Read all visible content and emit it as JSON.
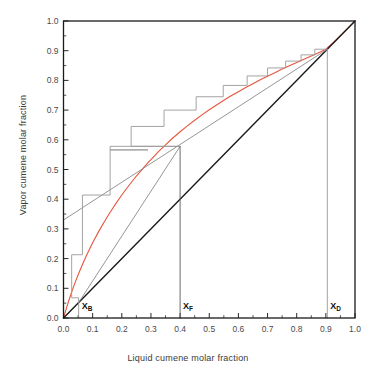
{
  "figure": {
    "kind": "mccabe-thiele-diagram",
    "background_color": "#ffffff",
    "frame_color": "#1a1a1a"
  },
  "axes": {
    "x_title": "Liquid cumene molar fraction",
    "y_title": "Vapor cumene molar fraction",
    "x_ticks": [
      "0.0",
      "0.1",
      "0.2",
      "0.3",
      "0.4",
      "0.5",
      "0.6",
      "0.7",
      "0.8",
      "0.9",
      "1.0"
    ],
    "y_ticks": [
      "0.0",
      "0.1",
      "0.2",
      "0.3",
      "0.4",
      "0.5",
      "0.6",
      "0.7",
      "0.8",
      "0.9",
      "1.0"
    ],
    "x_tick_values": [
      0.0,
      0.1,
      0.2,
      0.3,
      0.4,
      0.5,
      0.6,
      0.7,
      0.8,
      0.9,
      1.0
    ],
    "y_tick_values": [
      0.0,
      0.1,
      0.2,
      0.3,
      0.4,
      0.5,
      0.6,
      0.7,
      0.8,
      0.9,
      1.0
    ],
    "xlim": [
      0.0,
      1.0
    ],
    "ylim": [
      0.0,
      1.0
    ],
    "minor_tick_step": 0.05,
    "grid": false
  },
  "markers": [
    {
      "id": "xB",
      "label": "X",
      "sub": "B",
      "x": 0.052,
      "tick_label": "X_B"
    },
    {
      "id": "xF",
      "label": "X",
      "sub": "F",
      "x": 0.4,
      "tick_label": "X_F"
    },
    {
      "id": "xD",
      "label": "X",
      "sub": "D",
      "x": 0.905,
      "tick_label": "X_D"
    }
  ],
  "chart_data": {
    "type": "line",
    "title": "",
    "xlabel": "Liquid cumene molar fraction",
    "ylabel": "Vapor cumene molar fraction",
    "xlim": [
      0.0,
      1.0
    ],
    "ylim": [
      0.0,
      1.0
    ],
    "grid": false,
    "legend": "none",
    "series": [
      {
        "name": "equilibrium-curve",
        "color": "#e8553c",
        "width": 1.1,
        "points": [
          [
            0.0,
            0.0
          ],
          [
            0.01,
            0.033
          ],
          [
            0.02,
            0.064
          ],
          [
            0.03,
            0.093
          ],
          [
            0.04,
            0.12
          ],
          [
            0.052,
            0.15
          ],
          [
            0.065,
            0.18
          ],
          [
            0.08,
            0.213
          ],
          [
            0.1,
            0.253
          ],
          [
            0.12,
            0.29
          ],
          [
            0.14,
            0.324
          ],
          [
            0.16,
            0.356
          ],
          [
            0.18,
            0.386
          ],
          [
            0.2,
            0.414
          ],
          [
            0.225,
            0.447
          ],
          [
            0.25,
            0.478
          ],
          [
            0.275,
            0.506
          ],
          [
            0.29,
            0.523
          ],
          [
            0.3,
            0.533
          ],
          [
            0.325,
            0.559
          ],
          [
            0.35,
            0.583
          ],
          [
            0.375,
            0.606
          ],
          [
            0.4,
            0.627
          ],
          [
            0.425,
            0.647
          ],
          [
            0.45,
            0.666
          ],
          [
            0.475,
            0.684
          ],
          [
            0.5,
            0.701
          ],
          [
            0.525,
            0.717
          ],
          [
            0.55,
            0.733
          ],
          [
            0.575,
            0.748
          ],
          [
            0.6,
            0.762
          ],
          [
            0.625,
            0.776
          ],
          [
            0.65,
            0.789
          ],
          [
            0.675,
            0.802
          ],
          [
            0.7,
            0.814
          ],
          [
            0.725,
            0.826
          ],
          [
            0.75,
            0.838
          ],
          [
            0.775,
            0.849
          ],
          [
            0.8,
            0.86
          ],
          [
            0.825,
            0.871
          ],
          [
            0.85,
            0.882
          ],
          [
            0.875,
            0.893
          ],
          [
            0.9,
            0.905
          ],
          [
            0.925,
            0.927
          ],
          [
            0.95,
            0.951
          ],
          [
            0.975,
            0.975
          ],
          [
            1.0,
            1.0
          ]
        ]
      },
      {
        "name": "diagonal-45-line",
        "color": "#1a1a1a",
        "width": 1.4,
        "points": [
          [
            0.0,
            0.0
          ],
          [
            1.0,
            1.0
          ]
        ]
      },
      {
        "name": "rectifying-operating-line",
        "color": "#8a8a8a",
        "width": 0.9,
        "points": [
          [
            0.0,
            0.33
          ],
          [
            0.905,
            0.905
          ]
        ]
      },
      {
        "name": "stripping-operating-line",
        "color": "#8a8a8a",
        "width": 0.9,
        "points": [
          [
            0.052,
            0.052
          ],
          [
            0.4,
            0.578
          ]
        ]
      },
      {
        "name": "feed-q-line",
        "color": "#5a5a5a",
        "width": 0.9,
        "points": [
          [
            0.4,
            0.0
          ],
          [
            0.4,
            0.578
          ]
        ]
      },
      {
        "name": "xB-vertical-marker",
        "color": "#8a8a8a",
        "width": 0.8,
        "points": [
          [
            0.052,
            0.0
          ],
          [
            0.052,
            0.052
          ]
        ]
      },
      {
        "name": "xD-vertical-marker",
        "color": "#8a8a8a",
        "width": 0.8,
        "points": [
          [
            0.905,
            0.0
          ],
          [
            0.905,
            0.905
          ]
        ]
      }
    ],
    "stage_staircase": {
      "name": "theoretical-stage-steps",
      "color": "#9a9a9a",
      "width": 0.9,
      "description": "McCabe-Thiele stepping from xD down to xB; stripping steps below feed at x=0.40",
      "vertices": [
        [
          0.905,
          0.905
        ],
        [
          0.862,
          0.905
        ],
        [
          0.862,
          0.886
        ],
        [
          0.815,
          0.886
        ],
        [
          0.815,
          0.865
        ],
        [
          0.762,
          0.865
        ],
        [
          0.762,
          0.842
        ],
        [
          0.7,
          0.842
        ],
        [
          0.7,
          0.815
        ],
        [
          0.63,
          0.815
        ],
        [
          0.63,
          0.783
        ],
        [
          0.548,
          0.783
        ],
        [
          0.548,
          0.745
        ],
        [
          0.455,
          0.745
        ],
        [
          0.455,
          0.7
        ],
        [
          0.345,
          0.7
        ],
        [
          0.345,
          0.645
        ],
        [
          0.232,
          0.645
        ],
        [
          0.232,
          0.578
        ],
        [
          0.232,
          0.578
        ],
        [
          0.4,
          0.578
        ],
        [
          0.4,
          0.578
        ],
        [
          0.16,
          0.578
        ],
        [
          0.16,
          0.566
        ],
        [
          0.29,
          0.566
        ],
        [
          0.29,
          0.566
        ],
        [
          0.29,
          0.566
        ],
        [
          0.16,
          0.566
        ],
        [
          0.16,
          0.414
        ],
        [
          0.16,
          0.414
        ],
        [
          0.16,
          0.414
        ],
        [
          0.065,
          0.414
        ],
        [
          0.065,
          0.213
        ],
        [
          0.065,
          0.213
        ],
        [
          0.065,
          0.213
        ],
        [
          0.028,
          0.213
        ],
        [
          0.028,
          0.068
        ],
        [
          0.028,
          0.068
        ],
        [
          0.028,
          0.068
        ],
        [
          0.052,
          0.068
        ],
        [
          0.052,
          0.052
        ]
      ]
    }
  }
}
